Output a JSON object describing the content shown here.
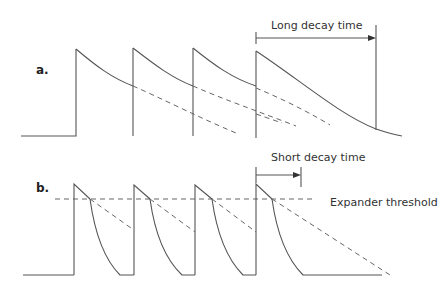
{
  "panels": [
    {
      "label": "a.",
      "annotation": "Long decay time",
      "description": "Pulses with long decay; envelopes overlap"
    },
    {
      "label": "b.",
      "annotation": "Short decay time",
      "threshold_label": "Expander threshold",
      "description": "Pulses with short decay below expander threshold"
    }
  ],
  "colors": {
    "line": "#555555",
    "dashed": "#666666",
    "text": "#333333",
    "background": "#ffffff"
  }
}
